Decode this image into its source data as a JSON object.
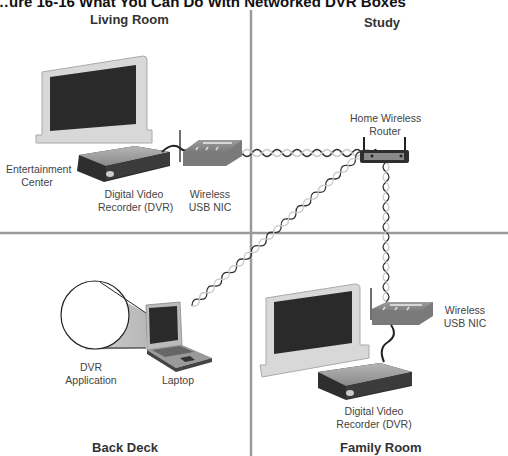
{
  "figure": {
    "title": "What You Can Do With Networked DVR Boxes",
    "title_visible_fragment": "…ure 16-16  What You Can Do With Networked DVR Boxes"
  },
  "rooms": {
    "living_room": "Living Room",
    "study": "Study",
    "back_deck": "Back Deck",
    "family_room": "Family Room"
  },
  "devices": {
    "entertainment_center": [
      "Entertainment",
      "Center"
    ],
    "dvr_living": [
      "Digital Video",
      "Recorder (DVR)"
    ],
    "nic_living": [
      "Wireless",
      "USB NIC"
    ],
    "router": [
      "Home Wireless",
      "Router"
    ],
    "dvr_app": [
      "DVR",
      "Application"
    ],
    "laptop": "Laptop",
    "nic_family": [
      "Wireless",
      "USB NIC"
    ],
    "dvr_family": [
      "Digital Video",
      "Recorder (DVR)"
    ]
  },
  "links": [
    {
      "from": "nic_living",
      "to": "router",
      "type": "wireless"
    },
    {
      "from": "laptop",
      "to": "router",
      "type": "wireless"
    },
    {
      "from": "nic_family",
      "to": "router",
      "type": "wireless"
    },
    {
      "from": "dvr_living",
      "to": "nic_living",
      "type": "cable"
    },
    {
      "from": "dvr_family",
      "to": "nic_family",
      "type": "cable"
    }
  ],
  "colors": {
    "divider": "#9a9a9a",
    "screen": "#2a2a2a",
    "tv_frame": "#d8d8d8",
    "device_dark": "#3a3a3a",
    "nic_body": "#8a8a8a",
    "wave": "#333333"
  }
}
